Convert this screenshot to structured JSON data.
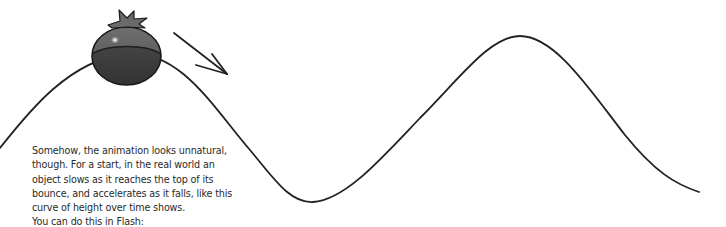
{
  "caption": {
    "lines": [
      "Somehow, the animation looks unnatural,",
      "though. For a start, in the real world an",
      "object slows as it reaches the top of its",
      "bounce, and accelerates as it falls, like this",
      "curve of height over time shows.",
      "You can do this in Flash:"
    ]
  },
  "illustration": {
    "curve": "height-over-time-wave",
    "ball": "tomato",
    "arrow": "downward-right-motion-arrow"
  },
  "colors": {
    "curve": "#222222",
    "tomato_top": "#5a5a5a",
    "tomato_bottom": "#3c3c3c",
    "stem": "#6a6a6a",
    "text": "#2a2a2a"
  }
}
